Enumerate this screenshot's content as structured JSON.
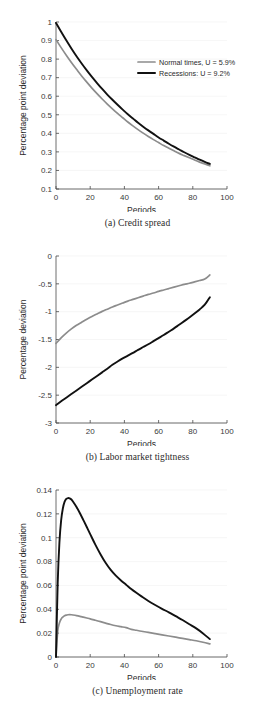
{
  "figure": {
    "background": "#ffffff",
    "panels": [
      {
        "id": "a",
        "caption": "(a) Credit spread"
      },
      {
        "id": "b",
        "caption": "(b) Labor market tightness"
      },
      {
        "id": "c",
        "caption": "(c) Unemployment rate"
      }
    ]
  },
  "legend": {
    "position": "upper-right-panel-a",
    "entries": [
      {
        "label": "Normal times, U = 5.9%",
        "color": "#8c8c8c"
      },
      {
        "label": "Recessions: U  = 9.2%",
        "color": "#111111"
      }
    ]
  },
  "colors": {
    "normal_times": "#8c8c8c",
    "recessions": "#111111",
    "axis": "#4a4a4a",
    "grid": "#f0f0f0",
    "text": "#2a2a2a"
  },
  "chart_data": [
    {
      "type": "line",
      "title": "(a) Credit spread",
      "xlabel": "Periods",
      "ylabel": "Percentage point deviation",
      "xlim": [
        0,
        100
      ],
      "ylim": [
        0.1,
        1.0
      ],
      "xticks": [
        0,
        20,
        40,
        60,
        80,
        100
      ],
      "xticklabels": [
        "0",
        "20",
        "40",
        "60",
        "80",
        "100"
      ],
      "yticks": [
        0.1,
        0.2,
        0.3,
        0.4,
        0.5,
        0.6,
        0.7,
        0.8,
        0.9,
        1
      ],
      "yticklabels": [
        "0.1",
        "0.2",
        "0.3",
        "0.4",
        "0.5",
        "0.6",
        "0.7",
        "0.8",
        "0.9",
        "1"
      ],
      "grid": false,
      "legend": [
        "Normal times, U = 5.9%",
        "Recessions: U  = 9.2%"
      ],
      "x": [
        0,
        3,
        6,
        9,
        12,
        15,
        18,
        21,
        24,
        27,
        30,
        33,
        36,
        39,
        42,
        45,
        48,
        51,
        54,
        57,
        60,
        63,
        66,
        69,
        72,
        75,
        78,
        81,
        84,
        87,
        90
      ],
      "series": [
        {
          "name": "Normal times, U = 5.9%",
          "color": "#8c8c8c",
          "values": [
            0.905,
            0.862,
            0.821,
            0.782,
            0.745,
            0.709,
            0.676,
            0.644,
            0.614,
            0.585,
            0.558,
            0.532,
            0.507,
            0.484,
            0.461,
            0.44,
            0.42,
            0.401,
            0.383,
            0.366,
            0.35,
            0.334,
            0.32,
            0.306,
            0.292,
            0.28,
            0.268,
            0.256,
            0.245,
            0.235,
            0.225
          ]
        },
        {
          "name": "Recessions: U  = 9.2%",
          "color": "#111111",
          "values": [
            0.995,
            0.947,
            0.901,
            0.857,
            0.815,
            0.776,
            0.739,
            0.704,
            0.671,
            0.639,
            0.609,
            0.581,
            0.554,
            0.528,
            0.503,
            0.48,
            0.457,
            0.436,
            0.416,
            0.397,
            0.378,
            0.361,
            0.344,
            0.328,
            0.313,
            0.298,
            0.284,
            0.271,
            0.258,
            0.246,
            0.235
          ]
        }
      ]
    },
    {
      "type": "line",
      "title": "(b) Labor market tightness",
      "xlabel": "Periods",
      "ylabel": "Percentage deviation",
      "xlim": [
        0,
        100
      ],
      "ylim": [
        -3,
        0
      ],
      "xticks": [
        0,
        20,
        40,
        60,
        80,
        100
      ],
      "xticklabels": [
        "0",
        "20",
        "40",
        "60",
        "80",
        "100"
      ],
      "yticks": [
        -3,
        -2.5,
        -2,
        -1.5,
        -1,
        -0.5,
        0
      ],
      "yticklabels": [
        "-3",
        "-2.5",
        "-2",
        "-1.5",
        "-1",
        "-0.5",
        "0"
      ],
      "grid": false,
      "x": [
        0,
        3,
        6,
        9,
        12,
        15,
        18,
        21,
        24,
        27,
        30,
        33,
        36,
        39,
        42,
        45,
        48,
        51,
        54,
        57,
        60,
        63,
        66,
        69,
        72,
        75,
        78,
        81,
        84,
        87,
        90
      ],
      "series": [
        {
          "name": "Normal times, U = 5.9%",
          "color": "#8c8c8c",
          "values": [
            -1.57,
            -1.47,
            -1.385,
            -1.31,
            -1.245,
            -1.19,
            -1.135,
            -1.085,
            -1.04,
            -0.995,
            -0.955,
            -0.915,
            -0.88,
            -0.845,
            -0.81,
            -0.78,
            -0.75,
            -0.72,
            -0.69,
            -0.665,
            -0.635,
            -0.61,
            -0.585,
            -0.56,
            -0.535,
            -0.51,
            -0.49,
            -0.465,
            -0.44,
            -0.415,
            -0.34
          ]
        },
        {
          "name": "Recessions: U  = 9.2%",
          "color": "#111111",
          "values": [
            -2.68,
            -2.61,
            -2.545,
            -2.48,
            -2.415,
            -2.35,
            -2.285,
            -2.22,
            -2.155,
            -2.09,
            -2.025,
            -1.955,
            -1.895,
            -1.84,
            -1.79,
            -1.74,
            -1.685,
            -1.635,
            -1.585,
            -1.53,
            -1.475,
            -1.42,
            -1.36,
            -1.3,
            -1.235,
            -1.17,
            -1.105,
            -1.035,
            -0.96,
            -0.875,
            -0.74
          ]
        }
      ]
    },
    {
      "type": "line",
      "title": "(c) Unemployment rate",
      "xlabel": "Periods",
      "ylabel": "Percentage point deviation",
      "xlim": [
        0,
        100
      ],
      "ylim": [
        0,
        0.14
      ],
      "xticks": [
        0,
        20,
        40,
        60,
        80,
        100
      ],
      "xticklabels": [
        "0",
        "20",
        "40",
        "60",
        "80",
        "100"
      ],
      "yticks": [
        0,
        0.02,
        0.04,
        0.06,
        0.08,
        0.1,
        0.12,
        0.14
      ],
      "yticklabels": [
        "0",
        "0.02",
        "0.04",
        "0.06",
        "0.08",
        "0.1",
        "0.12",
        "0.14"
      ],
      "grid": false,
      "x": [
        0,
        1,
        2,
        3,
        4,
        5,
        6,
        7,
        8,
        9,
        10,
        12,
        14,
        16,
        18,
        20,
        23,
        26,
        29,
        32,
        35,
        38,
        41,
        44,
        47,
        50,
        54,
        58,
        62,
        66,
        70,
        74,
        78,
        82,
        86,
        90
      ],
      "series": [
        {
          "name": "Normal times, U = 5.9%",
          "color": "#8c8c8c",
          "values": [
            0.0,
            0.0215,
            0.0285,
            0.0318,
            0.0335,
            0.0345,
            0.0351,
            0.0354,
            0.0355,
            0.0354,
            0.0352,
            0.0347,
            0.0341,
            0.0334,
            0.0327,
            0.032,
            0.0308,
            0.0296,
            0.0284,
            0.0272,
            0.0262,
            0.0254,
            0.0246,
            0.0232,
            0.0224,
            0.0216,
            0.0206,
            0.0196,
            0.0186,
            0.0176,
            0.0166,
            0.0156,
            0.0146,
            0.0136,
            0.0124,
            0.011
          ]
        },
        {
          "name": "Recessions: U  = 9.2%",
          "color": "#111111",
          "values": [
            0.0,
            0.062,
            0.096,
            0.1145,
            0.1245,
            0.13,
            0.1325,
            0.1332,
            0.133,
            0.132,
            0.1302,
            0.1258,
            0.1205,
            0.1148,
            0.109,
            0.103,
            0.0942,
            0.0862,
            0.079,
            0.073,
            0.0682,
            0.0642,
            0.0606,
            0.057,
            0.0538,
            0.0508,
            0.047,
            0.0436,
            0.0404,
            0.0374,
            0.0342,
            0.031,
            0.0275,
            0.024,
            0.0198,
            0.015
          ]
        }
      ]
    }
  ]
}
